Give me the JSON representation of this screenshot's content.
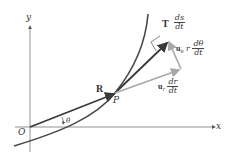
{
  "axes": {
    "x_label": "x",
    "y_label": "y",
    "origin_label": "O"
  },
  "point_label": "P",
  "angle_label": "θ",
  "vectors": {
    "position": {
      "label": "R"
    },
    "tangent": {
      "label": "T",
      "num": "ds",
      "den": "dt"
    },
    "radial": {
      "label": "u",
      "sub": "r",
      "num": "dr",
      "den": "dt"
    },
    "transverse": {
      "label": "u",
      "sub": "θ",
      "coef": "r",
      "num": "dθ",
      "den": "dt"
    }
  },
  "colors": {
    "dark_vector": "#3a3a3a",
    "light_vector": "#a8a8a8",
    "curve": "#4a4a4a",
    "axis": "#777777"
  }
}
